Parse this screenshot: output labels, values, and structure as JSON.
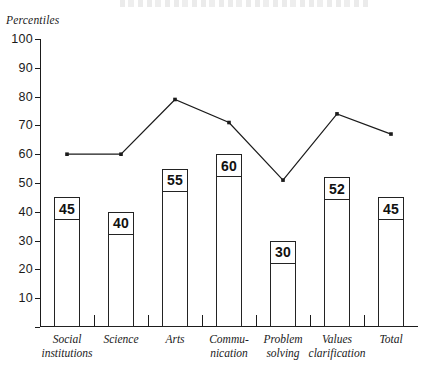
{
  "axis_title": "Percentiles",
  "chart_data": {
    "type": "bar",
    "title": "",
    "subtitle": "",
    "xlabel": "",
    "ylabel": "Percentiles",
    "ylim": [
      0,
      100
    ],
    "yticks": [
      0,
      10,
      20,
      30,
      40,
      50,
      60,
      70,
      80,
      90,
      100
    ],
    "ytick_labels": [
      "",
      "10",
      "20",
      "30",
      "40",
      "50",
      "60",
      "70",
      "80",
      "90",
      "100"
    ],
    "grid": false,
    "legend": "none",
    "categories": [
      "Social institutions",
      "Science",
      "Arts",
      "Communication",
      "Problem solving",
      "Values clarification",
      "Total"
    ],
    "category_lines": [
      [
        "Social",
        "institutions"
      ],
      [
        "Science"
      ],
      [
        "Arts"
      ],
      [
        "Commu-",
        "nication"
      ],
      [
        "Problem",
        "solving"
      ],
      [
        "Values",
        "clarification"
      ],
      [
        "Total"
      ]
    ],
    "series": [
      {
        "name": "Bars",
        "type": "bar",
        "values": [
          45,
          40,
          55,
          60,
          30,
          52,
          45
        ],
        "labels": [
          "45",
          "40",
          "55",
          "60",
          "30",
          "52",
          "45"
        ],
        "fill": "#ffffff",
        "edge": "#232323"
      },
      {
        "name": "Line",
        "type": "line",
        "values": [
          60,
          60,
          79,
          71,
          51,
          74,
          67
        ],
        "color": "#1b1b1b"
      }
    ]
  }
}
